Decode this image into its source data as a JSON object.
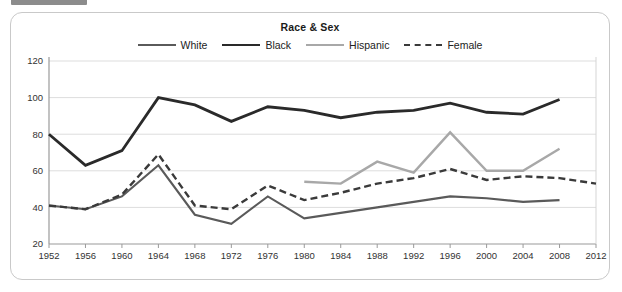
{
  "top_bar": {
    "chip_label": "",
    "left_text": "",
    "right_text": ""
  },
  "chart_panel": {
    "title": "Race & Sex"
  },
  "chart_data": {
    "type": "line",
    "title": "Race & Sex",
    "xlabel": "",
    "ylabel": "",
    "xlim": [
      1952,
      2012
    ],
    "ylim": [
      20,
      120
    ],
    "y_ticks": [
      20,
      40,
      60,
      80,
      100,
      120
    ],
    "x_ticks": [
      1952,
      1956,
      1960,
      1964,
      1968,
      1972,
      1976,
      1980,
      1984,
      1988,
      1992,
      1996,
      2000,
      2004,
      2008,
      2012
    ],
    "grid": true,
    "legend_position": "top-center",
    "series": [
      {
        "name": "White",
        "color": "#5a5a5a",
        "style": "solid",
        "width": 2.1,
        "x": [
          1952,
          1956,
          1960,
          1964,
          1968,
          1972,
          1976,
          1980,
          1984,
          1988,
          1992,
          1996,
          2000,
          2004,
          2008
        ],
        "values": [
          41,
          39,
          46,
          63,
          36,
          31,
          46,
          34,
          37,
          40,
          43,
          46,
          45,
          43,
          44
        ]
      },
      {
        "name": "Black",
        "color": "#2a2a2a",
        "style": "solid",
        "width": 2.8,
        "x": [
          1952,
          1956,
          1960,
          1964,
          1968,
          1972,
          1976,
          1980,
          1984,
          1988,
          1992,
          1996,
          2000,
          2004,
          2008
        ],
        "values": [
          80,
          63,
          71,
          100,
          96,
          87,
          95,
          93,
          89,
          92,
          93,
          97,
          92,
          91,
          99
        ]
      },
      {
        "name": "Hispanic",
        "color": "#a8a8a8",
        "style": "solid",
        "width": 2.4,
        "x": [
          1980,
          1984,
          1988,
          1992,
          1996,
          2000,
          2004,
          2008
        ],
        "values": [
          54,
          53,
          65,
          59,
          81,
          60,
          60,
          72
        ]
      },
      {
        "name": "Female",
        "color": "#3a3a3a",
        "style": "dashed",
        "width": 2.4,
        "x": [
          1952,
          1956,
          1960,
          1964,
          1968,
          1972,
          1976,
          1980,
          1984,
          1988,
          1992,
          1996,
          2000,
          2004,
          2008,
          2012
        ],
        "values": [
          41,
          39,
          47,
          69,
          41,
          39,
          52,
          44,
          48,
          53,
          56,
          61,
          55,
          57,
          56,
          53
        ]
      }
    ]
  }
}
